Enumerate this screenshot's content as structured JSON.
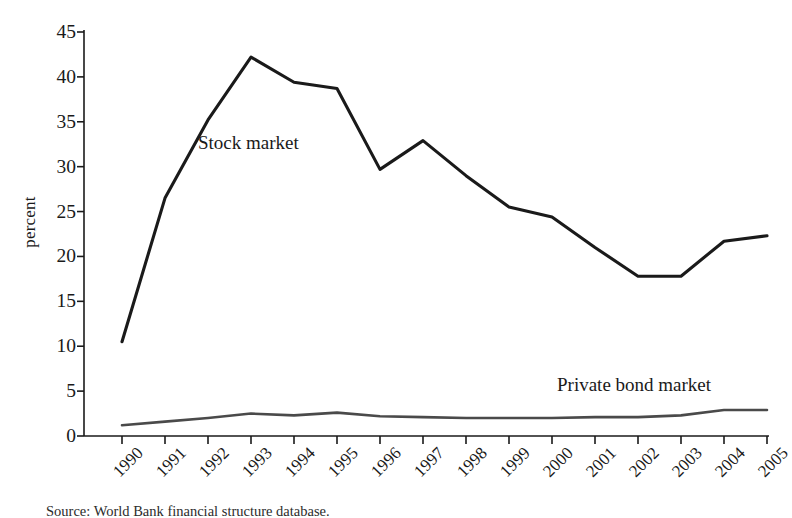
{
  "chart_data": {
    "type": "line",
    "title": "",
    "xlabel": "",
    "ylabel": "percent",
    "xlim": [
      1990,
      2005
    ],
    "ylim": [
      0,
      45
    ],
    "grid": false,
    "legend_position": "inline-annotations",
    "categories": [
      "1990",
      "1991",
      "1992",
      "1993",
      "1994",
      "1995",
      "1996",
      "1997",
      "1998",
      "1999",
      "2000",
      "2001",
      "2002",
      "2003",
      "2004",
      "2005"
    ],
    "yticks": [
      "0",
      "5",
      "10",
      "15",
      "20",
      "25",
      "30",
      "35",
      "40",
      "45"
    ],
    "series": [
      {
        "name": "Stock market",
        "color": "#1a1a1a",
        "values": [
          10.5,
          26.5,
          35.2,
          42.2,
          39.4,
          38.7,
          29.7,
          32.9,
          29.0,
          25.5,
          24.4,
          21.0,
          17.8,
          17.8,
          21.7,
          22.3
        ]
      },
      {
        "name": "Private bond market",
        "color": "#4a4a4a",
        "values": [
          1.2,
          1.6,
          2.0,
          2.5,
          2.3,
          2.6,
          2.2,
          2.1,
          2.0,
          2.0,
          2.0,
          2.1,
          2.1,
          2.3,
          2.9,
          2.9
        ]
      }
    ],
    "annotations": [
      {
        "text": "Stock market",
        "series": "Stock market"
      },
      {
        "text": "Private bond market",
        "series": "Private bond market"
      }
    ]
  },
  "figure": {
    "ylabel": "percent",
    "annotation_stock": "Stock market",
    "annotation_bond": "Private bond market",
    "caption": "Source: World Bank financial structure database."
  }
}
